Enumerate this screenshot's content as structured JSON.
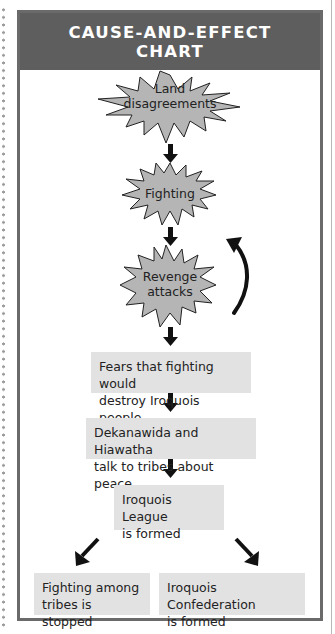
{
  "header": {
    "title_line1": "CAUSE-AND-EFFECT",
    "title_line2": "CHART"
  },
  "bursts": [
    {
      "line1": "Land",
      "line2": "disagreements"
    },
    {
      "line1": "Fighting"
    },
    {
      "line1": "Revenge",
      "line2": "attacks"
    }
  ],
  "cycle_arrow": {
    "from": "Revenge attacks",
    "to": "Fighting",
    "icon": "curved-arrow-up-icon"
  },
  "boxes": [
    {
      "line1": "Fears that fighting would",
      "line2": "destroy Iroquois people"
    },
    {
      "line1": "Dekanawida and Hiawatha",
      "line2": "talk to tribes about peace"
    },
    {
      "line1": "Iroquois League",
      "line2": "is formed"
    }
  ],
  "outcomes": [
    {
      "line1": "Fighting among",
      "line2": "tribes is stopped"
    },
    {
      "line1": "Iroquois Confederation",
      "line2": "is formed"
    }
  ],
  "colors": {
    "header_bg": "#5e5e5e",
    "border": "#6a6a6a",
    "burst_fill": "#b5b5b5",
    "box_fill": "#e2e2e2",
    "arrow": "#111111"
  }
}
